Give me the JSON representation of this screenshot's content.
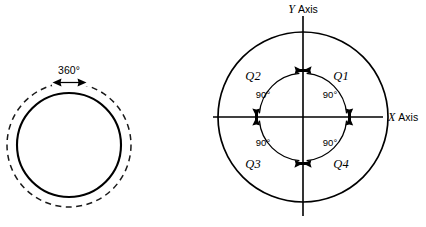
{
  "figure": {
    "background_color": "#ffffff",
    "stroke_color": "#000000",
    "left_diagram": {
      "name": "full-rotation-circle",
      "rotation_label": "360°",
      "solid_circle": {
        "cx": 69,
        "cy": 145,
        "r": 52
      },
      "dashed_circle": {
        "cx": 69,
        "cy": 145,
        "r": 62
      }
    },
    "right_diagram": {
      "name": "quadrant-axes-circle",
      "axis_labels": {
        "x_symbol": "X",
        "x_word": "Axis",
        "y_symbol": "Y",
        "y_word": "Axis"
      },
      "circle": {
        "cx": 303,
        "cy": 117,
        "r": 85
      },
      "inner_arc_radius": 44,
      "quadrants": [
        {
          "id": "Q1",
          "label": "Q1",
          "angle_label": "90°",
          "label_x": 341,
          "label_y": 76,
          "deg_x": 330,
          "deg_y": 98
        },
        {
          "id": "Q2",
          "label": "Q2",
          "angle_label": "90°",
          "label_x": 253,
          "label_y": 76,
          "deg_x": 263,
          "deg_y": 98
        },
        {
          "id": "Q3",
          "label": "Q3",
          "angle_label": "90°",
          "label_x": 253,
          "label_y": 165,
          "deg_x": 263,
          "deg_y": 146
        },
        {
          "id": "Q4",
          "label": "Q4",
          "angle_label": "90°",
          "label_x": 341,
          "label_y": 165,
          "deg_x": 330,
          "deg_y": 146
        }
      ]
    }
  }
}
